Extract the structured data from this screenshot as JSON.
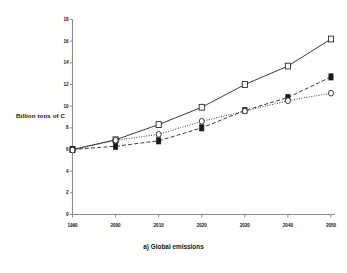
{
  "chart_data": {
    "type": "line",
    "title": "",
    "caption": "a) Global emissions",
    "xlabel": "",
    "ylabel": "Billion tons of C",
    "x": [
      1990,
      2000,
      2010,
      2020,
      2030,
      2040,
      2050
    ],
    "xticklabels": [
      "1990",
      "2000",
      "2010",
      "2020",
      "2030",
      "2040",
      "2050"
    ],
    "yticklabels": [
      "0",
      "2",
      "4",
      "6",
      "8",
      "10",
      "12",
      "14",
      "16",
      "18"
    ],
    "yticks": [
      0,
      2,
      4,
      6,
      8,
      10,
      12,
      14,
      16,
      18
    ],
    "xlim": [
      1990,
      2050
    ],
    "ylim": [
      0,
      18
    ],
    "grid": false,
    "legend": "none",
    "series": [
      {
        "name": "open-square-solid",
        "marker": "open-square",
        "linestyle": "solid",
        "color": "#1a1a1a",
        "values": [
          6.0,
          6.9,
          8.3,
          9.9,
          12.0,
          13.7,
          16.2
        ]
      },
      {
        "name": "filled-square-dashed",
        "marker": "filled-square",
        "linestyle": "dashed",
        "color": "#1a1a1a",
        "values": [
          6.0,
          6.3,
          6.8,
          8.0,
          9.6,
          10.8,
          12.7
        ]
      },
      {
        "name": "open-circle-dotted",
        "marker": "open-circle",
        "linestyle": "dotted",
        "color": "#1a1a1a",
        "values": [
          5.95,
          6.85,
          7.4,
          8.6,
          9.55,
          10.5,
          11.2
        ]
      }
    ]
  }
}
